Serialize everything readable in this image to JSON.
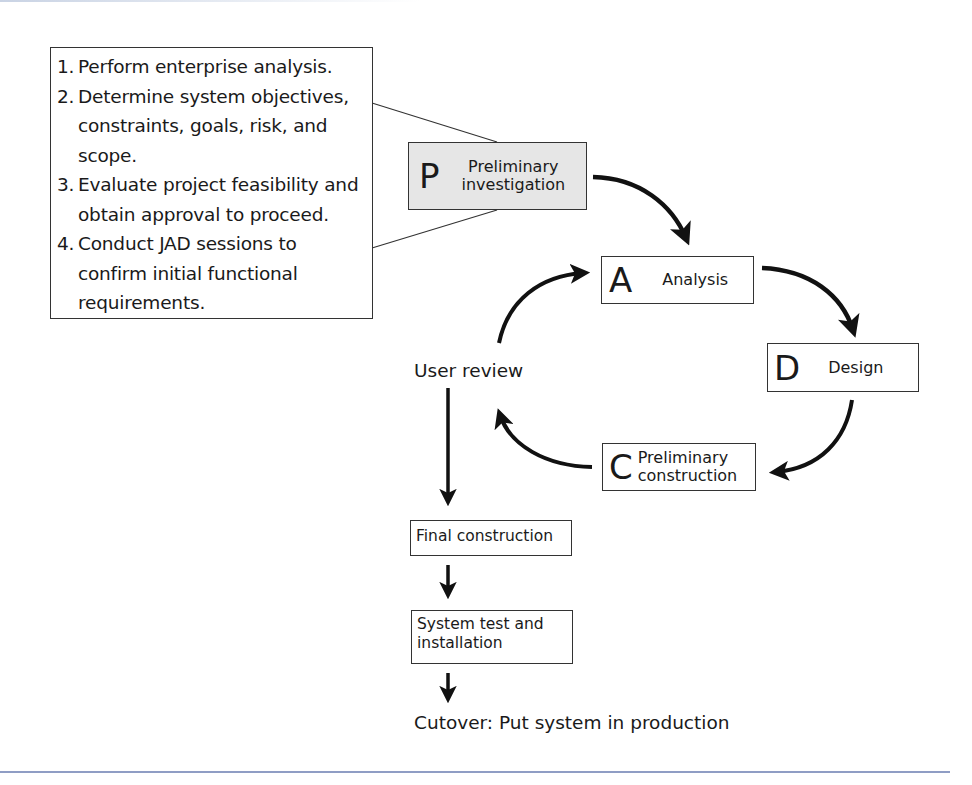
{
  "diagram": {
    "type": "process-flow"
  },
  "steps_box": {
    "items": [
      {
        "num": "1.",
        "text": "Perform enterprise analysis."
      },
      {
        "num": "2.",
        "text": "Determine system objectives, constraints, goals, risk, and scope."
      },
      {
        "num": "3.",
        "text": "Evaluate project feasibility and obtain approval to proceed."
      },
      {
        "num": "4.",
        "text": "Conduct JAD sessions to confirm initial functional requirements."
      }
    ]
  },
  "phases": {
    "preliminary_investigation": {
      "letter": "P",
      "line1": "Preliminary",
      "line2": "investigation",
      "fill": "#e6e6e6"
    },
    "analysis": {
      "letter": "A",
      "label": "Analysis"
    },
    "design": {
      "letter": "D",
      "label": "Design"
    },
    "preliminary_construction": {
      "letter": "C",
      "line1": "Preliminary",
      "line2": "construction"
    }
  },
  "user_review": {
    "label": "User review"
  },
  "final_construction": {
    "label": "Final construction"
  },
  "system_test": {
    "line1": "System test and",
    "line2": "installation"
  },
  "cutover": {
    "label": "Cutover: Put system in production"
  },
  "edges": [
    {
      "from": "preliminary_investigation",
      "to": "analysis"
    },
    {
      "from": "analysis",
      "to": "design"
    },
    {
      "from": "design",
      "to": "preliminary_construction"
    },
    {
      "from": "preliminary_construction",
      "to": "user_review"
    },
    {
      "from": "user_review",
      "to": "analysis"
    },
    {
      "from": "user_review",
      "to": "final_construction"
    },
    {
      "from": "final_construction",
      "to": "system_test"
    },
    {
      "from": "system_test",
      "to": "cutover"
    }
  ],
  "colors": {
    "stroke": "#1a1a1a",
    "rule": "#8f9dc4"
  }
}
